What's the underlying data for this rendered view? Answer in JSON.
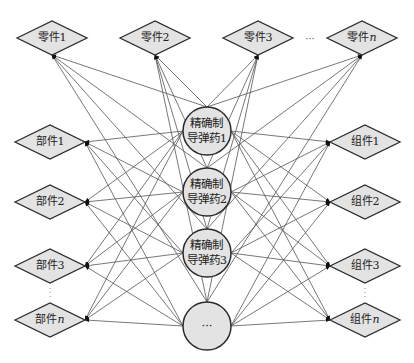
{
  "colors": {
    "node_fill": "#e3e3e3",
    "node_stroke": "#2b2b2b",
    "edge": "#555555",
    "background": "#ffffff"
  },
  "top_row": {
    "nodes": [
      {
        "label": "零件1",
        "x": 52,
        "y": 38
      },
      {
        "label": "零件2",
        "x": 155,
        "y": 38
      },
      {
        "label": "零件3",
        "x": 258,
        "y": 38
      },
      {
        "label": "零件n",
        "x": 362,
        "y": 38
      }
    ],
    "ellipsis": {
      "text": "···",
      "x": 310,
      "y": 38
    }
  },
  "left_column": {
    "nodes": [
      {
        "label": "部件1",
        "x": 50,
        "y": 142
      },
      {
        "label": "部件2",
        "x": 50,
        "y": 202
      },
      {
        "label": "部件3",
        "x": 50,
        "y": 266
      },
      {
        "label": "部件n",
        "x": 50,
        "y": 320
      }
    ],
    "vdots": {
      "text": "·\n·\n·",
      "x": 50,
      "y": 293
    }
  },
  "right_column": {
    "nodes": [
      {
        "label": "组件1",
        "x": 365,
        "y": 142
      },
      {
        "label": "组件2",
        "x": 365,
        "y": 202
      },
      {
        "label": "组件3",
        "x": 365,
        "y": 266
      },
      {
        "label": "组件n",
        "x": 365,
        "y": 320
      }
    ],
    "vdots": {
      "text": "·\n·\n·",
      "x": 365,
      "y": 293
    }
  },
  "center_column": {
    "nodes": [
      {
        "label": "精确制\n导弹药1",
        "x": 207,
        "y": 131
      },
      {
        "label": "精确制\n导弹药2",
        "x": 207,
        "y": 192
      },
      {
        "label": "精确制\n导弹药3",
        "x": 207,
        "y": 253
      },
      {
        "label": "···",
        "x": 207,
        "y": 326
      }
    ],
    "radius": 24
  },
  "diamond": {
    "half_width": 35,
    "half_height": 17
  }
}
